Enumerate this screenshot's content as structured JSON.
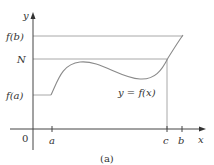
{
  "figure": {
    "caption": "(a)",
    "axes": {
      "x_label": "x",
      "y_label": "y",
      "origin_label": "0"
    },
    "x_ticks": [
      {
        "label": "a",
        "x": 52
      },
      {
        "label": "c",
        "x": 167
      },
      {
        "label": "b",
        "x": 182
      }
    ],
    "y_levels": [
      {
        "label": "f(b)",
        "y": 36
      },
      {
        "label": "N",
        "y": 59
      },
      {
        "label": "f(a)",
        "y": 95
      }
    ],
    "curve_label": "y = f(x)",
    "colors": {
      "lines": "#9a9a9a",
      "axes": "#333333",
      "text": "#333333"
    }
  }
}
